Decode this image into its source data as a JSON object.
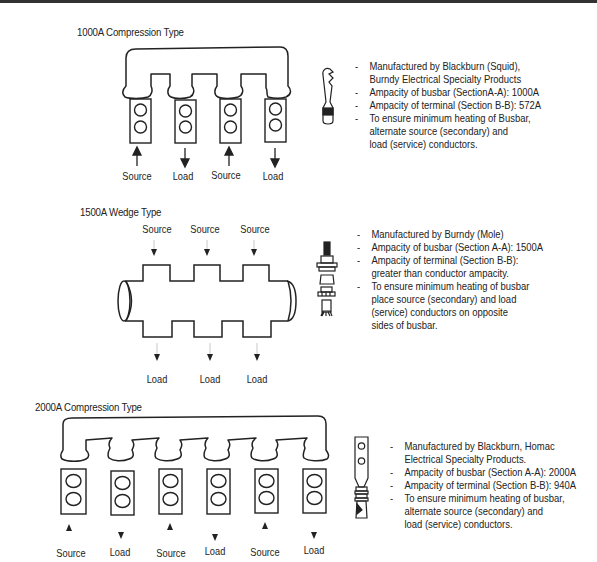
{
  "page": {
    "header_rule": true
  },
  "sections": [
    {
      "id": "1000a",
      "title": "1000A Compression Type",
      "labels": [
        "Source",
        "Load",
        "Source",
        "Load"
      ],
      "arrows": [
        "up",
        "down",
        "up",
        "down"
      ],
      "terminal_icon": "squid-terminal-icon",
      "notes": [
        {
          "lines": [
            "Manufactured by Blackburn (Squid),",
            "Burndy Electrical Specialty Products"
          ]
        },
        {
          "lines": [
            "Ampacity of busbar (SectionA-A): 1000A"
          ]
        },
        {
          "lines": [
            "Ampacity of terminal (Section B-B): 572A"
          ]
        },
        {
          "lines": [
            "To ensure minimum heating of Busbar,",
            "alternate source (secondary) and",
            "load (service) conductors."
          ]
        }
      ]
    },
    {
      "id": "1500a",
      "title": "1500A Wedge Type",
      "top_labels": [
        "Source",
        "Source",
        "Source"
      ],
      "bottom_labels": [
        "Load",
        "Load",
        "Load"
      ],
      "terminal_icon": "wedge-terminal-icon",
      "notes": [
        {
          "lines": [
            "Manufactured by Burndy (Mole)"
          ]
        },
        {
          "lines": [
            "Ampacity of busbar (Section A-A): 1500A"
          ]
        },
        {
          "lines": [
            "Ampacity of terminal (Section B-B):",
            "greater than conductor ampacity."
          ]
        },
        {
          "lines": [
            "To ensure minimum heating of busbar",
            "place source (secondary) and load",
            "(service) conductors on opposite",
            "sides of busbar."
          ]
        }
      ]
    },
    {
      "id": "2000a",
      "title": "2000A Compression Type",
      "labels": [
        "Source",
        "Load",
        "Source",
        "Load",
        "Source",
        "Load"
      ],
      "arrows": [
        "up",
        "down",
        "up",
        "down",
        "up",
        "down"
      ],
      "terminal_icon": "compression-terminal-icon",
      "notes": [
        {
          "lines": [
            "Manufactured by Blackburn, Homac",
            "Electrical Specialty Products."
          ]
        },
        {
          "lines": [
            "Ampacity of busbar (Section A-A): 2000A"
          ]
        },
        {
          "lines": [
            "Ampacity of terminal (Section B-B): 940A"
          ]
        },
        {
          "lines": [
            "To ensure minimum heating of busbar,",
            "alternate source (secondary) and",
            "load (service) conductors."
          ]
        }
      ]
    }
  ],
  "colors": {
    "ink": "#222222",
    "background": "#ffffff"
  }
}
